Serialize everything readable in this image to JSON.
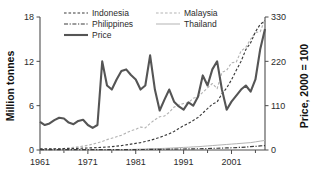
{
  "chart_data": {
    "type": "line",
    "title": "",
    "xlabel": "",
    "ylabel": "Million tonnes",
    "y2label": "Price, 2000 = 100",
    "xlim": [
      1961,
      2008
    ],
    "ylim": [
      0,
      18
    ],
    "y2lim": [
      0,
      330
    ],
    "grid": false,
    "legend_position": "top-center",
    "xticks": [
      1961,
      1971,
      1981,
      1991,
      2001
    ],
    "xticklabels": [
      "1961",
      "1971",
      "1981",
      "1991",
      "2001"
    ],
    "xminorticks": [
      1966,
      1976,
      1986,
      1996,
      2006
    ],
    "yticks": [
      0,
      6,
      12,
      18
    ],
    "yticklabels": [
      "0",
      "6",
      "12",
      "18"
    ],
    "y2ticks": [
      0,
      110,
      220,
      330
    ],
    "y2ticklabels": [
      "0",
      "110",
      "220",
      "330"
    ],
    "x": [
      1961,
      1962,
      1963,
      1964,
      1965,
      1966,
      1967,
      1968,
      1969,
      1970,
      1971,
      1972,
      1973,
      1974,
      1975,
      1976,
      1977,
      1978,
      1979,
      1980,
      1981,
      1982,
      1983,
      1984,
      1985,
      1986,
      1987,
      1988,
      1989,
      1990,
      1991,
      1992,
      1993,
      1994,
      1995,
      1996,
      1997,
      1998,
      1999,
      2000,
      2001,
      2002,
      2003,
      2004,
      2005,
      2006,
      2007,
      2008
    ],
    "series": [
      {
        "name": "Indonesia",
        "axis": "left",
        "style": "dashed",
        "color": "#3b3b3b",
        "unit": "Million tonnes",
        "values": [
          0.15,
          0.15,
          0.15,
          0.16,
          0.17,
          0.18,
          0.19,
          0.2,
          0.22,
          0.25,
          0.27,
          0.3,
          0.33,
          0.37,
          0.4,
          0.45,
          0.52,
          0.6,
          0.69,
          0.79,
          0.9,
          1.0,
          1.15,
          1.3,
          1.5,
          1.7,
          1.95,
          2.2,
          2.5,
          2.9,
          3.3,
          3.6,
          4.0,
          4.4,
          5.0,
          5.6,
          6.2,
          6.5,
          7.6,
          8.4,
          9.5,
          10.8,
          12.0,
          13.6,
          14.5,
          16.0,
          17.0,
          17.5
        ]
      },
      {
        "name": "Malaysia",
        "axis": "left",
        "style": "dashed-light",
        "color": "#b3b3b3",
        "unit": "Million tonnes",
        "values": [
          0.1,
          0.12,
          0.14,
          0.15,
          0.18,
          0.22,
          0.28,
          0.35,
          0.43,
          0.52,
          0.63,
          0.8,
          0.95,
          1.15,
          1.4,
          1.6,
          1.8,
          2.0,
          2.3,
          2.6,
          2.8,
          3.1,
          3.0,
          3.6,
          4.1,
          4.5,
          4.6,
          5.1,
          5.8,
          6.1,
          6.3,
          6.4,
          7.0,
          7.2,
          7.8,
          8.4,
          9.0,
          8.3,
          10.5,
          10.8,
          11.8,
          11.9,
          13.4,
          13.9,
          15.0,
          15.9,
          16.0,
          17.7
        ]
      },
      {
        "name": "Philippines",
        "axis": "left",
        "style": "dashdot",
        "color": "#3b3b3b",
        "unit": "Million tonnes",
        "values": [
          0.05,
          0.05,
          0.05,
          0.05,
          0.05,
          0.05,
          0.05,
          0.05,
          0.05,
          0.05,
          0.05,
          0.05,
          0.05,
          0.05,
          0.05,
          0.05,
          0.05,
          0.06,
          0.06,
          0.06,
          0.06,
          0.07,
          0.07,
          0.08,
          0.08,
          0.09,
          0.1,
          0.11,
          0.12,
          0.13,
          0.14,
          0.15,
          0.16,
          0.17,
          0.18,
          0.2,
          0.22,
          0.24,
          0.26,
          0.28,
          0.3,
          0.33,
          0.36,
          0.4,
          0.45,
          0.5,
          0.55,
          0.6
        ]
      },
      {
        "name": "Thailand",
        "axis": "left",
        "style": "solid-light",
        "color": "#b3b3b3",
        "unit": "Million tonnes",
        "values": [
          0.02,
          0.02,
          0.02,
          0.02,
          0.02,
          0.02,
          0.02,
          0.02,
          0.02,
          0.02,
          0.02,
          0.02,
          0.03,
          0.03,
          0.04,
          0.04,
          0.05,
          0.06,
          0.07,
          0.08,
          0.1,
          0.12,
          0.14,
          0.16,
          0.18,
          0.2,
          0.22,
          0.25,
          0.28,
          0.32,
          0.35,
          0.38,
          0.42,
          0.45,
          0.5,
          0.55,
          0.6,
          0.65,
          0.7,
          0.75,
          0.8,
          0.85,
          0.9,
          0.95,
          1.0,
          1.1,
          1.2,
          1.3
        ]
      },
      {
        "name": "Price",
        "axis": "right",
        "style": "solid-thick",
        "color": "#555555",
        "unit": "Price, 2000 = 100",
        "values": [
          70,
          62,
          66,
          74,
          80,
          78,
          68,
          64,
          72,
          75,
          62,
          55,
          62,
          220,
          160,
          150,
          175,
          196,
          200,
          186,
          175,
          150,
          160,
          235,
          150,
          98,
          125,
          150,
          120,
          108,
          100,
          118,
          110,
          132,
          185,
          160,
          200,
          220,
          150,
          100,
          120,
          135,
          150,
          160,
          145,
          175,
          250,
          300
        ]
      }
    ]
  },
  "axes": {
    "left_title": "Million tonnes",
    "right_title": "Price, 2000 = 100"
  },
  "legend": {
    "entries": [
      {
        "label": "Indonesia",
        "style": "dashed",
        "color": "#3b3b3b"
      },
      {
        "label": "Malaysia",
        "style": "dashed-light",
        "color": "#b3b3b3"
      },
      {
        "label": "Philippines",
        "style": "dashdot",
        "color": "#3b3b3b"
      },
      {
        "label": "Thailand",
        "style": "solid-light",
        "color": "#b3b3b3"
      },
      {
        "label": "Price",
        "style": "solid-thick",
        "color": "#555555"
      }
    ]
  },
  "colors": {
    "dark_line": "#3b3b3b",
    "light_line": "#b3b3b3",
    "price_line": "#555555",
    "axis": "#4d4d4d",
    "text": "#2b2b2b",
    "background": "#ffffff"
  }
}
